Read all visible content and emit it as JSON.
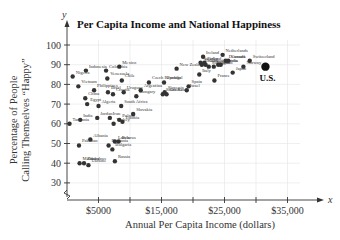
{
  "chart_data": {
    "type": "scatter",
    "title": "Per Capita Income and National Happiness",
    "xlabel": "Annual Per Capita Income (dollars)",
    "ylabel_line1": "Percentage of People",
    "ylabel_line2": "Calling Themselves “Happy”",
    "x_var": "x",
    "y_var": "y",
    "xlim": [
      0,
      40000
    ],
    "ylim": [
      25,
      100
    ],
    "x_ticks": [
      5000,
      10000,
      15000,
      20000,
      25000,
      30000,
      35000
    ],
    "x_tick_labels": [
      "$5000",
      "$15,000",
      "$25,000",
      "$35,000"
    ],
    "y_ticks": [
      30,
      40,
      50,
      60,
      70,
      80,
      90,
      100
    ],
    "y_tick_labels": [
      "30",
      "40",
      "50",
      "60",
      "70",
      "80",
      "90",
      "100"
    ],
    "grid": true,
    "highlight": {
      "label": "U.S.",
      "x": 31500,
      "y": 89
    },
    "points": [
      {
        "label": "Nigeria",
        "x": 900,
        "y": 84
      },
      {
        "label": "Vietnam",
        "x": 1800,
        "y": 79
      },
      {
        "label": "Indonesia",
        "x": 3000,
        "y": 87
      },
      {
        "label": "Colombia",
        "x": 6200,
        "y": 87
      },
      {
        "label": "Venezuela",
        "x": 6400,
        "y": 83
      },
      {
        "label": "Mexico",
        "x": 8300,
        "y": 89
      },
      {
        "label": "Chile",
        "x": 8700,
        "y": 82
      },
      {
        "label": "Philippines",
        "x": 4300,
        "y": 77
      },
      {
        "label": "Brazl",
        "x": 6500,
        "y": 76
      },
      {
        "label": "Croatia",
        "x": 7300,
        "y": 75
      },
      {
        "label": "Uruguay",
        "x": 9000,
        "y": 76
      },
      {
        "label": "China",
        "x": 2900,
        "y": 73
      },
      {
        "label": "Egypt",
        "x": 3200,
        "y": 70
      },
      {
        "label": "Algeria",
        "x": 5000,
        "y": 69
      },
      {
        "label": "South Africa",
        "x": 8600,
        "y": 69
      },
      {
        "label": "Argentina",
        "x": 11700,
        "y": 77
      },
      {
        "label": "Hungary",
        "x": 11000,
        "y": 74
      },
      {
        "label": "Czech Republic",
        "x": 13000,
        "y": 81
      },
      {
        "label": "Portugal",
        "x": 15400,
        "y": 81
      },
      {
        "label": "New Zealand",
        "x": 17400,
        "y": 88
      },
      {
        "label": "Spain",
        "x": 19300,
        "y": 79
      },
      {
        "label": "Israel",
        "x": 19000,
        "y": 77
      },
      {
        "label": "Slovenia",
        "x": 15500,
        "y": 76
      },
      {
        "label": "South Korea",
        "x": 15200,
        "y": 75
      },
      {
        "label": "Greece",
        "x": 15800,
        "y": 75
      },
      {
        "label": "India",
        "x": 2100,
        "y": 62
      },
      {
        "label": "Jordan",
        "x": 4800,
        "y": 63
      },
      {
        "label": "Iran",
        "x": 6800,
        "y": 63
      },
      {
        "label": "Turkey",
        "x": 7400,
        "y": 60
      },
      {
        "label": "Slovakia",
        "x": 10500,
        "y": 65
      },
      {
        "label": "Poland",
        "x": 8300,
        "y": 62
      },
      {
        "label": "Estonia",
        "x": 8800,
        "y": 61
      },
      {
        "label": "Tanzania",
        "x": 400,
        "y": 60
      },
      {
        "label": "Albania",
        "x": 3700,
        "y": 52
      },
      {
        "label": "Pakistan",
        "x": 1900,
        "y": 49
      },
      {
        "label": "Latvia",
        "x": 7600,
        "y": 51
      },
      {
        "label": "Belarus",
        "x": 8200,
        "y": 51
      },
      {
        "label": "Romania",
        "x": 6600,
        "y": 49
      },
      {
        "label": "Bulgaria",
        "x": 7200,
        "y": 47
      },
      {
        "label": "Moldova",
        "x": 2000,
        "y": 40
      },
      {
        "label": "Ukraine",
        "x": 3400,
        "y": 39
      },
      {
        "label": "Zimbabwe",
        "x": 2700,
        "y": 40
      },
      {
        "label": "Russia",
        "x": 7600,
        "y": 41
      },
      {
        "label": "Ireland",
        "x": 21600,
        "y": 94
      },
      {
        "label": "Netherlands",
        "x": 24700,
        "y": 95
      },
      {
        "label": "Switzerland",
        "x": 29000,
        "y": 92
      },
      {
        "label": "Norway",
        "x": 28000,
        "y": 89
      },
      {
        "label": "Italy",
        "x": 21000,
        "y": 85
      },
      {
        "label": "France",
        "x": 23400,
        "y": 82
      },
      {
        "label": "Japan",
        "x": 26300,
        "y": 86
      },
      {
        "label": "Canada",
        "x": 25600,
        "y": 92
      },
      {
        "label": "Denmark",
        "x": 25200,
        "y": 92
      },
      {
        "label": "Austria",
        "x": 24400,
        "y": 90
      },
      {
        "label": "Belgium",
        "x": 23300,
        "y": 89
      },
      {
        "label": "Australia",
        "x": 24000,
        "y": 90
      },
      {
        "label": "Germany",
        "x": 22000,
        "y": 90
      },
      {
        "label": "Finland",
        "x": 21800,
        "y": 91
      },
      {
        "label": "Sweden",
        "x": 21200,
        "y": 91
      },
      {
        "label": "Singapore",
        "x": 22500,
        "y": 89
      },
      {
        "label": "Britain",
        "x": 21400,
        "y": 90
      }
    ]
  }
}
